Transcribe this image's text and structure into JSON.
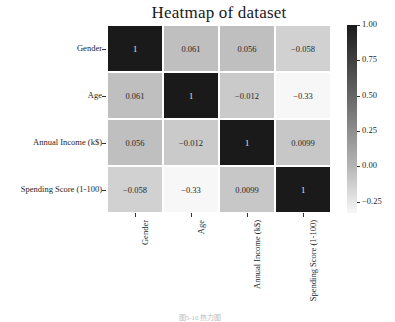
{
  "chart_data": {
    "type": "heatmap",
    "title": "Heatmap of dataset",
    "xlabel": "",
    "ylabel": "",
    "row_labels": [
      "Gender",
      "Age",
      "Annual Income (k$)",
      "Spending Score (1-100)"
    ],
    "col_labels": [
      "Gender",
      "Age",
      "Annual Income (k$)",
      "Spending Score (1-100)"
    ],
    "values": [
      [
        1,
        0.061,
        0.056,
        -0.058
      ],
      [
        0.061,
        1,
        -0.012,
        -0.33
      ],
      [
        0.056,
        -0.012,
        1,
        0.0099
      ],
      [
        -0.058,
        -0.33,
        0.0099,
        1
      ]
    ],
    "annotations": [
      [
        "1",
        "0.061",
        "0.056",
        "−0.058"
      ],
      [
        "0.061",
        "1",
        "−0.012",
        "−0.33"
      ],
      [
        "0.056",
        "−0.012",
        "1",
        "0.0099"
      ],
      [
        "−0.058",
        "−0.33",
        "0.0099",
        "1"
      ]
    ],
    "colorbar": {
      "ticks": [
        "1.00",
        "0.75",
        "0.50",
        "0.25",
        "0.00",
        "−0.25"
      ],
      "range": [
        -0.33,
        1.0
      ],
      "colormap": "Greys"
    }
  },
  "caption": "图5-10 热力图"
}
